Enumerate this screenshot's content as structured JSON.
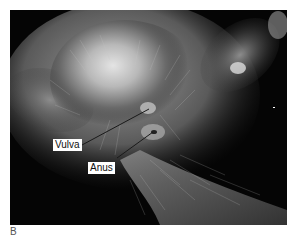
{
  "figure": {
    "panel_letter": "B",
    "labels": [
      {
        "text": "Vulva",
        "points_to": "vulva"
      },
      {
        "text": "Anus",
        "points_to": "anus"
      }
    ],
    "colors": {
      "background": "#050505",
      "fur_light": "#d8d8d8",
      "label_bg": "#ffffff",
      "label_text": "#111111",
      "pointer_line": "#1a1a1a"
    }
  }
}
